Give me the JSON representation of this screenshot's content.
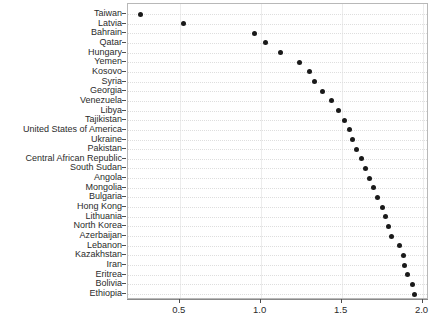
{
  "chart_data": {
    "type": "scatter",
    "title": "",
    "subtitle": "",
    "xlabel": "",
    "ylabel": "",
    "grid": true,
    "legend": null,
    "orientation": "horizontal",
    "xlim": [
      0.18,
      2.04
    ],
    "xticks": [
      0.5,
      1.0,
      1.5,
      2.0
    ],
    "xtick_labels": [
      "0.5",
      "1.0",
      "1.5",
      "2.0"
    ],
    "categories": [
      "Taiwan",
      "Latvia",
      "Bahrain",
      "Qatar",
      "Hungary",
      "Yemen",
      "Kosovo",
      "Syria",
      "Georgia",
      "Venezuela",
      "Libya",
      "Tajikistan",
      "United States of America",
      "Ukraine",
      "Pakistan",
      "Central African Republic",
      "South Sudan",
      "Angola",
      "Mongolia",
      "Bulgaria",
      "Hong Kong",
      "Lithuania",
      "North Korea",
      "Azerbaijan",
      "Lebanon",
      "Kazakhstan",
      "Iran",
      "Eritrea",
      "Bolivia",
      "Ethiopia"
    ],
    "values": [
      0.26,
      0.52,
      0.96,
      1.03,
      1.12,
      1.24,
      1.3,
      1.33,
      1.38,
      1.44,
      1.48,
      1.52,
      1.55,
      1.57,
      1.59,
      1.62,
      1.65,
      1.67,
      1.7,
      1.72,
      1.75,
      1.77,
      1.79,
      1.81,
      1.86,
      1.88,
      1.89,
      1.91,
      1.94,
      1.95
    ],
    "marker": {
      "shape": "circle",
      "color": "#1a1a1a",
      "size": 5
    },
    "axis_color": "#b8b8b8",
    "gridline_color": "#dedede",
    "background_color": "#ffffff"
  }
}
